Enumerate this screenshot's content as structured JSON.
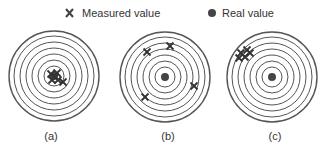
{
  "legend": {
    "measured_label": "Measured value",
    "measured_icon": "x-mark-icon",
    "real_label": "Real value",
    "real_icon": "filled-dot-icon"
  },
  "colors": {
    "ink": "#333333",
    "ring": "#555555",
    "dot": "#444444",
    "background": "#ffffff"
  },
  "targets": [
    {
      "label": "(a)",
      "cx": 54,
      "cy": 76,
      "rings": [
        45,
        40,
        34,
        28,
        22,
        16,
        10
      ],
      "points": [
        [
          -3,
          -2
        ],
        [
          3,
          -3
        ],
        [
          -2,
          4
        ],
        [
          4,
          4
        ],
        [
          9,
          6
        ],
        [
          1,
          1
        ]
      ]
    },
    {
      "label": "(b)",
      "cx": 165,
      "cy": 77,
      "rings": [
        45,
        40,
        34,
        28,
        22,
        16,
        10
      ],
      "points": [
        [
          -18,
          -25
        ],
        [
          5,
          -31
        ],
        [
          29,
          9
        ],
        [
          -20,
          20
        ]
      ]
    },
    {
      "label": "(c)",
      "cx": 272,
      "cy": 77,
      "rings": [
        45,
        40,
        34,
        28,
        22,
        16,
        10
      ],
      "points": [
        [
          -31,
          -24
        ],
        [
          -25,
          -27
        ],
        [
          -33,
          -19
        ],
        [
          -27,
          -20
        ],
        [
          -22,
          -24
        ]
      ]
    }
  ]
}
